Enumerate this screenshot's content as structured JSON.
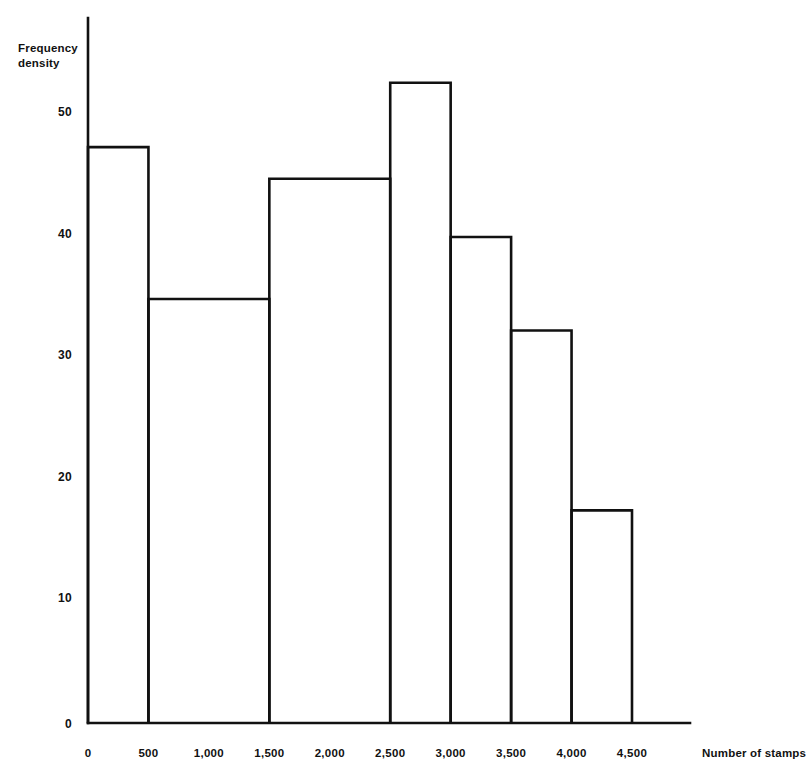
{
  "chart_data": {
    "type": "bar",
    "title": "",
    "subtitle": "",
    "xlabel": "Number of stamps",
    "ylabel": "Frequency density",
    "grid": false,
    "legend": false,
    "xlim": [
      0,
      4750
    ],
    "ylim": [
      0,
      56
    ],
    "xticks": [
      0,
      500,
      1000,
      1500,
      2000,
      2500,
      3000,
      3500,
      4000,
      4500
    ],
    "xtick_labels": [
      "0",
      "500",
      "1,000",
      "1,500",
      "2,000",
      "2,500",
      "3,000",
      "3,500",
      "4,000",
      "4,500"
    ],
    "yticks": [
      0,
      10,
      20,
      30,
      40,
      50
    ],
    "ytick_labels": [
      "0",
      "10",
      "20",
      "30",
      "40",
      "50"
    ],
    "bins": [
      {
        "label": "0 - 500",
        "x0": 0,
        "x1": 500,
        "value": 47.4
      },
      {
        "label": "500 - 1,500",
        "x0": 500,
        "x1": 1500,
        "value": 34.9
      },
      {
        "label": "1,500 - 2,500",
        "x0": 1500,
        "x1": 2500,
        "value": 44.8
      },
      {
        "label": "2,500 - 3,000",
        "x0": 2500,
        "x1": 3000,
        "value": 52.7
      },
      {
        "label": "3,000 - 3,500",
        "x0": 3000,
        "x1": 3500,
        "value": 40.0
      },
      {
        "label": "3,500 - 4,000",
        "x0": 3500,
        "x1": 4000,
        "value": 32.3
      },
      {
        "label": "4,000 - 4,500",
        "x0": 4000,
        "x1": 4500,
        "value": 17.5
      }
    ],
    "categories": [
      "0 - 500",
      "500 - 1,500",
      "1,500 - 2,500",
      "2,500 - 3,000",
      "3,000 - 3,500",
      "3,500 - 4,000",
      "4,000 - 4,500"
    ],
    "values": [
      47.4,
      34.9,
      44.8,
      52.7,
      40.0,
      32.3,
      17.5
    ],
    "colors": {
      "bar_stroke": "#111111",
      "bar_fill": "#ffffff",
      "axis": "#111111",
      "background": "#ffffff"
    }
  },
  "axis": {
    "y_title_line1": "Frequency",
    "y_title_line2": "density",
    "x_title": "Number of stamps"
  }
}
